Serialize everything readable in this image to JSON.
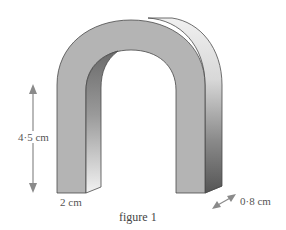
{
  "figure": {
    "caption": "figure 1",
    "shape": "arch (horseshoe-shaped prism)",
    "labels": {
      "height": "4·5 cm",
      "width": "2 cm",
      "depth": "0·8 cm"
    },
    "colors": {
      "front_face": "#b4b4b4",
      "side_light": "#eeeeee",
      "side_dark": "#6a6a6a",
      "outline": "#4a4a4a",
      "arrow": "#8a8a8a"
    }
  }
}
